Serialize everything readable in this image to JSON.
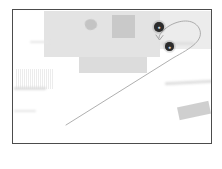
{
  "app": {
    "title": "Map View",
    "screen_width": 222,
    "screen_height": 169
  },
  "map": {
    "name": "blurred-map-view",
    "background_color": "#ffffff",
    "border_color": "#4c4c4c",
    "frame": {
      "x": 12,
      "y": 9,
      "width": 200,
      "height": 135
    },
    "buildings": [
      {
        "name": "large-block-north",
        "x": 31,
        "y": 1,
        "w": 116,
        "h": 46,
        "color": "#e3e3e3"
      },
      {
        "name": "block-north-right",
        "x": 147,
        "y": 1,
        "w": 53,
        "h": 38,
        "color": "#ececec"
      },
      {
        "name": "rooftop-structure",
        "x": 99,
        "y": 5,
        "w": 23,
        "h": 23,
        "color": "#c9c9c9"
      },
      {
        "name": "courtyard-block",
        "x": 66,
        "y": 47,
        "w": 68,
        "h": 16,
        "color": "#dcdcdc"
      },
      {
        "name": "tilted-block-east",
        "x": 165,
        "y": 94,
        "w": 32,
        "h": 13,
        "color": "#cfcfcf"
      }
    ],
    "vegetation": [
      {
        "name": "tree-blob",
        "x": 72,
        "y": 9,
        "w": 12,
        "h": 11,
        "color": "#c4c4c4"
      }
    ],
    "structures": [
      {
        "name": "striped-parking-structure",
        "x": 2,
        "y": 59,
        "w": 38,
        "h": 20
      }
    ],
    "street_labels": [
      {
        "name": "label-bar-west-top",
        "x": 17,
        "y": 31,
        "w": 20,
        "h": 2
      },
      {
        "name": "label-bar-east-top",
        "x": 148,
        "y": 32,
        "w": 33,
        "h": 3
      },
      {
        "name": "label-bar-west-mid",
        "x": 1,
        "y": 77,
        "w": 32,
        "h": 3
      },
      {
        "name": "label-bar-west-low",
        "x": 1,
        "y": 100,
        "w": 22,
        "h": 2
      },
      {
        "name": "label-bar-east-mid",
        "x": 152,
        "y": 71,
        "w": 47,
        "h": 3
      }
    ],
    "pins": [
      {
        "name": "map-pin-upper",
        "x": 141,
        "y": 12,
        "size": 10,
        "color": "#1b1b1b",
        "glyph": "●"
      },
      {
        "name": "map-pin-lower",
        "x": 152,
        "y": 32,
        "size": 9,
        "color": "#1b1b1b",
        "glyph": "●"
      }
    ],
    "annotation": {
      "name": "route-arrow",
      "stroke_color": "#9a9a9a",
      "stroke_width": 0.8,
      "path": "M 53 115 L 160 48 C 178 38 192 30 186 18 C 180 8 166 10 156 16 C 150 20 146 24 146 28",
      "arrow_tip_x": 146,
      "arrow_tip_y": 30
    }
  }
}
